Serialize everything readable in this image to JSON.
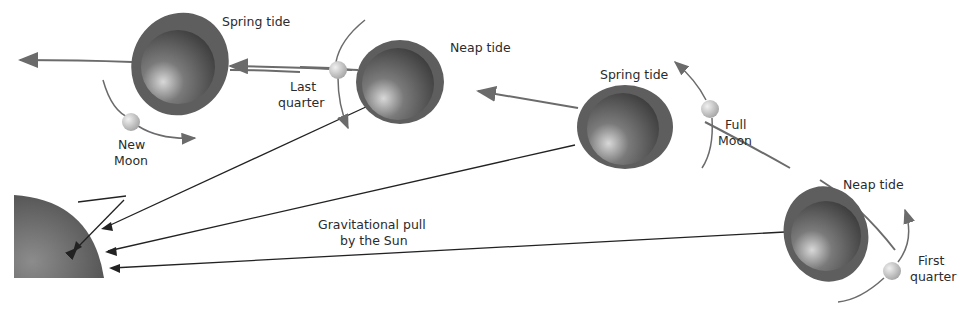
{
  "diagram": {
    "colors": {
      "bulge": "#5e5e5e",
      "earth_dark": "#3a3a3a",
      "earth_light": "#8a8a8a",
      "orbit_arrow": "#6b6b6b",
      "pull_arrow": "#222222",
      "sun": "#555555",
      "moon": "#c8c8c8"
    },
    "sun": {
      "label": ""
    },
    "positions": [
      {
        "tide_label": "Spring tide",
        "moon_label_line1": "New",
        "moon_label_line2": "Moon"
      },
      {
        "tide_label": "Neap tide",
        "moon_label_line1": "Last",
        "moon_label_line2": "quarter"
      },
      {
        "tide_label": "Spring tide",
        "moon_label_line1": "Full",
        "moon_label_line2": "Moon"
      },
      {
        "tide_label": "Neap tide",
        "moon_label_line1": "First",
        "moon_label_line2": "quarter"
      }
    ],
    "pull_label_line1": "Gravitational pull",
    "pull_label_line2": "by the Sun"
  }
}
